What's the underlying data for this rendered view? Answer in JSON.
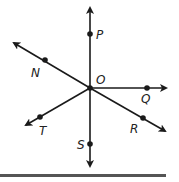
{
  "diagram": {
    "type": "rays-from-point",
    "center": {
      "label": "O",
      "x": 90,
      "y": 88
    },
    "points": [
      {
        "label": "P",
        "x": 90,
        "y": 34,
        "label_x": 96,
        "label_y": 39
      },
      {
        "label": "N",
        "x": 45,
        "y": 60,
        "label_x": 30,
        "label_y": 77
      },
      {
        "label": "Q",
        "x": 147,
        "y": 88,
        "label_x": 141,
        "label_y": 103
      },
      {
        "label": "R",
        "x": 143,
        "y": 118,
        "label_x": 129,
        "label_y": 133
      },
      {
        "label": "S",
        "x": 90,
        "y": 144,
        "label_x": 77,
        "label_y": 148
      },
      {
        "label": "T",
        "x": 40,
        "y": 117,
        "label_x": 39,
        "label_y": 135
      }
    ],
    "center_label_pos": {
      "x": 96,
      "y": 84
    },
    "line_color": "#1a1a1a",
    "bar_color": "#555555"
  }
}
